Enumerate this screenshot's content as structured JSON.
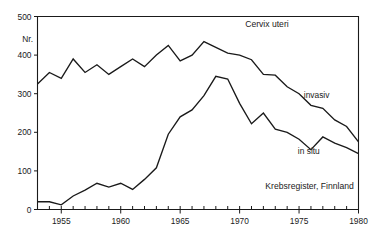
{
  "chart_data": {
    "type": "line",
    "title": "Cervix uteri",
    "xlabel": "",
    "ylabel": "Nr.",
    "xlim": [
      1953,
      1980
    ],
    "ylim": [
      0,
      500
    ],
    "grid": false,
    "legend_position": "inline-right",
    "source": "Krebsregister, Finnland",
    "y_ticks": [
      0,
      100,
      200,
      300,
      400,
      500
    ],
    "y_tick_labels": [
      "0",
      "100",
      "200",
      "300",
      "400",
      "500"
    ],
    "x_ticks": [
      1955,
      1960,
      1965,
      1970,
      1975,
      1980
    ],
    "x_tick_labels": [
      "1955",
      "1960",
      "1965",
      "1970",
      "1975",
      "1980"
    ],
    "x_minor_tick_interval": 1,
    "x": [
      1953,
      1954,
      1955,
      1956,
      1957,
      1958,
      1959,
      1960,
      1961,
      1962,
      1963,
      1964,
      1965,
      1966,
      1967,
      1968,
      1969,
      1970,
      1971,
      1972,
      1973,
      1974,
      1975,
      1976,
      1977,
      1978,
      1979,
      1980
    ],
    "series": [
      {
        "name": "invasiv",
        "label": "invasiv",
        "color": "#1a1a1a",
        "values": [
          325,
          355,
          340,
          390,
          355,
          375,
          350,
          370,
          390,
          370,
          400,
          425,
          385,
          400,
          435,
          420,
          405,
          400,
          388,
          350,
          348,
          318,
          300,
          270,
          262,
          232,
          215,
          175
        ]
      },
      {
        "name": "in situ",
        "label": "in situ",
        "color": "#1a1a1a",
        "values": [
          20,
          20,
          12,
          35,
          50,
          68,
          58,
          68,
          52,
          78,
          108,
          195,
          240,
          258,
          295,
          345,
          338,
          275,
          222,
          250,
          208,
          200,
          182,
          155,
          188,
          172,
          160,
          145
        ]
      }
    ],
    "annotations": [
      {
        "text": "Cervix uteri",
        "x": 1972.3,
        "y": 472
      },
      {
        "text": "invasiv",
        "x": 1975.4,
        "y": 288
      },
      {
        "text": "in situ",
        "x": 1974.9,
        "y": 143
      },
      {
        "text": "Krebsregister, Finnland",
        "x": 1979.6,
        "y": 52
      }
    ]
  },
  "axes": {
    "y_unit_label": "Nr."
  }
}
